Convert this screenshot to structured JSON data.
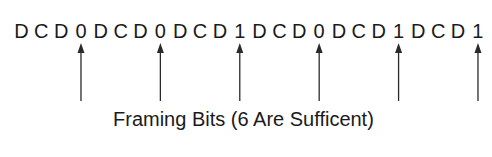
{
  "diagram": {
    "bit_sequence": [
      "D",
      "C",
      "D",
      "0",
      "D",
      "C",
      "D",
      "0",
      "D",
      "C",
      "D",
      "1",
      "D",
      "C",
      "D",
      "0",
      "D",
      "C",
      "D",
      "1",
      "D",
      "C",
      "D",
      "1"
    ],
    "framing_bits": [
      {
        "index": 3,
        "value": "0"
      },
      {
        "index": 7,
        "value": "0"
      },
      {
        "index": 11,
        "value": "1"
      },
      {
        "index": 15,
        "value": "0"
      },
      {
        "index": 19,
        "value": "1"
      },
      {
        "index": 23,
        "value": "1"
      }
    ],
    "caption": "Framing Bits (6 Are Sufficent)",
    "colors": {
      "text": "#1a1a1a",
      "arrow": "#2a2a2a",
      "background": "#ffffff"
    }
  }
}
